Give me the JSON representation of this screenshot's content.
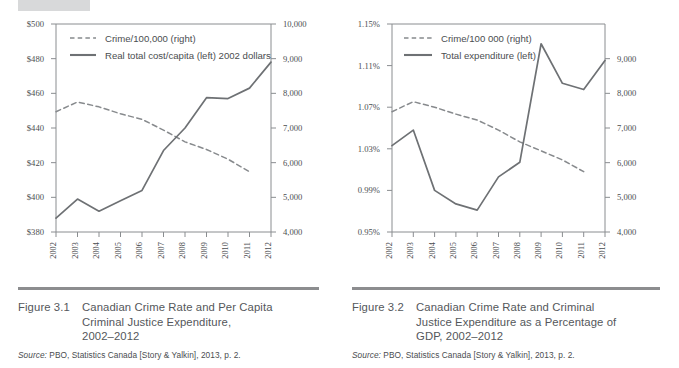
{
  "page": {
    "background": "#ffffff",
    "ink": "#4a4d50",
    "rule_color": "#8c8d8f",
    "line_color": "#6e7174"
  },
  "figures": [
    {
      "id": "figure-3-1",
      "number": "Figure 3.1",
      "title": "Canadian Crime Rate and Per Capita Criminal Justice Expenditure, 2002–2012",
      "title_lines": [
        "Canadian Crime Rate and Per Capita",
        "Criminal Justice Expenditure,",
        "2002–2012"
      ],
      "source_label": "Source:",
      "source_text": "PBO, Statistics Canada [Story & Yalkin], 2013, p. 2."
    },
    {
      "id": "figure-3-2",
      "number": "Figure 3.2",
      "title": "Canadian Crime Rate and Criminal Justice Expenditure as a Percentage of GDP, 2002–2012",
      "title_lines": [
        "Canadian Crime Rate and Criminal",
        "Justice Expenditure as a Percentage of",
        "GDP, 2002–2012"
      ],
      "source_label": "Source:",
      "source_text": "PBO, Statistics Canada [Story & Yalkin], 2013, p. 2."
    }
  ],
  "chart_data": [
    {
      "type": "line",
      "id": "chart-3-1",
      "title": "Canadian Crime Rate and Per Capita Criminal Justice Expenditure, 2002–2012",
      "xlabel": "",
      "ylabel": "",
      "grid": false,
      "legend_position": "top-left",
      "categories": [
        "2002",
        "2003",
        "2004",
        "2005",
        "2006",
        "2007",
        "2008",
        "2009",
        "2010",
        "2011",
        "2012"
      ],
      "x": [
        2002,
        2003,
        2004,
        2005,
        2006,
        2007,
        2008,
        2009,
        2010,
        2011,
        2012
      ],
      "axes": {
        "left": {
          "label": "Real total cost/capita (2002 dollars)",
          "ylim": [
            380,
            500
          ],
          "ticks": [
            380,
            400,
            420,
            440,
            460,
            480,
            500
          ],
          "ticklabels": [
            "$380",
            "$400",
            "$420",
            "$440",
            "$460",
            "$480",
            "$500"
          ]
        },
        "right": {
          "label": "Crime per 100,000",
          "ylim": [
            4000,
            10000
          ],
          "ticks": [
            4000,
            5000,
            6000,
            7000,
            8000,
            9000,
            10000
          ],
          "ticklabels": [
            "4,000",
            "5,000",
            "6,000",
            "7,000",
            "8,000",
            "9,000",
            "10,000"
          ]
        }
      },
      "series": [
        {
          "name": "Crime/100,000 (right)",
          "legend_label": "Crime/100,000 (right)",
          "axis": "right",
          "style": "dashed",
          "color": "#878a8d",
          "x": [
            2002,
            2003,
            2004,
            2005,
            2006,
            2007,
            2008,
            2009,
            2010,
            2011
          ],
          "values": [
            7470,
            7750,
            7610,
            7410,
            7250,
            6940,
            6600,
            6380,
            6100,
            5740
          ]
        },
        {
          "name": "Real total cost/capita (left) 2002 dollars",
          "legend_label": "Real total cost/capita (left) 2002 dollars",
          "axis": "left",
          "style": "solid",
          "color": "#6e7174",
          "x": [
            2002,
            2003,
            2004,
            2005,
            2006,
            2007,
            2008,
            2009,
            2010,
            2011,
            2012
          ],
          "values": [
            388,
            399,
            392,
            398,
            404,
            427,
            440,
            457.5,
            457,
            463,
            478
          ]
        }
      ]
    },
    {
      "type": "line",
      "id": "chart-3-2",
      "title": "Canadian Crime Rate and Criminal Justice Expenditure as a Percentage of GDP, 2002–2012",
      "xlabel": "",
      "ylabel": "",
      "grid": false,
      "legend_position": "top-left",
      "categories": [
        "2002",
        "2003",
        "2004",
        "2005",
        "2006",
        "2007",
        "2008",
        "2009",
        "2010",
        "2011",
        "2012"
      ],
      "x": [
        2002,
        2003,
        2004,
        2005,
        2006,
        2007,
        2008,
        2009,
        2010,
        2011,
        2012
      ],
      "axes": {
        "left": {
          "label": "Total expenditure as % of GDP",
          "ylim": [
            0.95,
            1.15
          ],
          "ticks": [
            0.95,
            0.99,
            1.03,
            1.07,
            1.11,
            1.15
          ],
          "ticklabels": [
            "0.95%",
            "0.99%",
            "1.03%",
            "1.07%",
            "1.11%",
            "1.15%"
          ]
        },
        "right": {
          "label": "Crime per 100 000",
          "ylim": [
            4000,
            10000
          ],
          "ticks": [
            4000,
            5000,
            6000,
            7000,
            8000,
            9000
          ],
          "ticklabels": [
            "4,000",
            "5,000",
            "6,000",
            "7,000",
            "8,000",
            "9,000"
          ]
        }
      },
      "series": [
        {
          "name": "Crime/100 000 (right)",
          "legend_label": "Crime/100 000 (right)",
          "axis": "right",
          "style": "dashed",
          "color": "#878a8d",
          "x": [
            2002,
            2003,
            2004,
            2005,
            2006,
            2007,
            2008,
            2009,
            2010,
            2011
          ],
          "values": [
            7470,
            7760,
            7600,
            7400,
            7230,
            6940,
            6600,
            6340,
            6080,
            5740
          ]
        },
        {
          "name": "Total expenditure (left)",
          "legend_label": "Total expenditure (left)",
          "axis": "left",
          "style": "solid",
          "color": "#6e7174",
          "x": [
            2002,
            2003,
            2004,
            2005,
            2006,
            2007,
            2008,
            2009,
            2010,
            2011,
            2012
          ],
          "values": [
            1.033,
            1.048,
            0.99,
            0.977,
            0.971,
            1.003,
            1.017,
            1.131,
            1.093,
            1.087,
            1.115
          ]
        }
      ]
    }
  ]
}
